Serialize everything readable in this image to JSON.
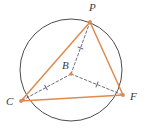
{
  "figure": {
    "background_color": "#ffffff"
  },
  "labels": {
    "p": "P",
    "b": "B",
    "c": "C",
    "f": "F"
  },
  "colors": {
    "circle_stroke": "#4c4c4c",
    "triangle_stroke": "#e08a4e",
    "radius_stroke": "#6b6b8a",
    "point_fill": "#e08a4e",
    "label_text": "#3a3a3a"
  },
  "chart_data": {
    "type": "diagram",
    "subtype": "euclidean-geometry",
    "circle": {
      "name": "B",
      "center": {
        "x": 71,
        "y": 70
      },
      "radius": 51,
      "stroke": "#4c4c4c",
      "stroke_width": 1,
      "fill": "none"
    },
    "points": [
      {
        "name": "P",
        "x": 90,
        "y": 22,
        "label_dx": 2,
        "label_dy": -12,
        "on_circle": true
      },
      {
        "name": "C",
        "x": 21,
        "y": 101,
        "label_dx": -12,
        "label_dy": 1,
        "on_circle": true
      },
      {
        "name": "F",
        "x": 123,
        "y": 95,
        "label_dx": 8,
        "label_dy": 1,
        "on_circle": true
      },
      {
        "name": "B",
        "x": 71,
        "y": 74,
        "label_dx": -8,
        "label_dy": -8,
        "on_circle": false
      }
    ],
    "segments": [
      {
        "name": "PC",
        "from": "P",
        "to": "C",
        "style": "solid",
        "stroke": "#e08a4e",
        "stroke_width": 1.5,
        "ticks": 0
      },
      {
        "name": "PF",
        "from": "P",
        "to": "F",
        "style": "solid",
        "stroke": "#e08a4e",
        "stroke_width": 1.5,
        "ticks": 0
      },
      {
        "name": "CF",
        "from": "C",
        "to": "F",
        "style": "solid",
        "stroke": "#e08a4e",
        "stroke_width": 1.5,
        "ticks": 0
      },
      {
        "name": "BP",
        "from": "B",
        "to": "P",
        "style": "dashed",
        "stroke": "#6b6b8a",
        "stroke_width": 1,
        "ticks": 1
      },
      {
        "name": "BC",
        "from": "B",
        "to": "C",
        "style": "dashed",
        "stroke": "#6b6b8a",
        "stroke_width": 1,
        "ticks": 1
      },
      {
        "name": "BF",
        "from": "B",
        "to": "F",
        "style": "dashed",
        "stroke": "#6b6b8a",
        "stroke_width": 1,
        "ticks": 1
      }
    ],
    "legend": [],
    "grid": false,
    "annotations": [
      "Triangle PCF is inscribed in circle B",
      "Segments BP, BC and BF are congruent radii marked with single tick marks"
    ]
  }
}
